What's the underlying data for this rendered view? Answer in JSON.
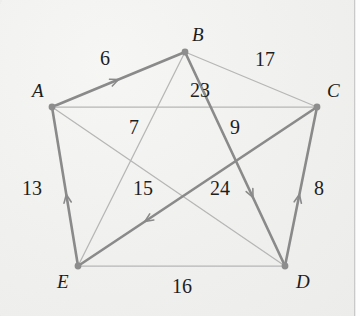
{
  "diagram": {
    "background_color": "#f1f1ef",
    "edge_color": "#8a8a8a",
    "thin_edge_color": "#b6b6b6",
    "node_color": "#8d8d8d",
    "label_color": "#1c1c1c"
  },
  "vertices": [
    {
      "id": "A",
      "label": "A",
      "x": 52,
      "y": 107,
      "label_x": 32,
      "label_y": 81
    },
    {
      "id": "B",
      "label": "B",
      "x": 185,
      "y": 52,
      "label_x": 192,
      "label_y": 25
    },
    {
      "id": "C",
      "label": "C",
      "x": 317,
      "y": 107,
      "label_x": 327,
      "label_y": 81
    },
    {
      "id": "D",
      "label": "D",
      "x": 285,
      "y": 266,
      "label_x": 296,
      "label_y": 272
    },
    {
      "id": "E",
      "label": "E",
      "x": 78,
      "y": 266,
      "label_x": 57,
      "label_y": 272
    }
  ],
  "edges": [
    {
      "id": "AB",
      "from": "A",
      "to": "B",
      "weight": "6",
      "directed": true,
      "style": "thick",
      "label_x": 100,
      "label_y": 48
    },
    {
      "id": "BC",
      "from": "B",
      "to": "C",
      "weight": "17",
      "directed": false,
      "style": "thin",
      "label_x": 255,
      "label_y": 49
    },
    {
      "id": "BE",
      "from": "B",
      "to": "E",
      "weight": "23",
      "directed": false,
      "style": "thin",
      "label_x": 190,
      "label_y": 80
    },
    {
      "id": "AC",
      "from": "A",
      "to": "C",
      "weight": "7",
      "directed": false,
      "style": "thin",
      "label_x": 129,
      "label_y": 117
    },
    {
      "id": "BD",
      "from": "B",
      "to": "D",
      "weight": "9",
      "directed": true,
      "style": "thick",
      "label_x": 230,
      "label_y": 117
    },
    {
      "id": "EA",
      "from": "E",
      "to": "A",
      "weight": "13",
      "directed": true,
      "style": "thick",
      "label_x": 22,
      "label_y": 178
    },
    {
      "id": "AD",
      "from": "A",
      "to": "D",
      "weight": "15",
      "directed": false,
      "style": "thin",
      "label_x": 133,
      "label_y": 178
    },
    {
      "id": "CE",
      "from": "C",
      "to": "E",
      "weight": "24",
      "directed": true,
      "style": "thick",
      "label_x": 210,
      "label_y": 178
    },
    {
      "id": "DC",
      "from": "D",
      "to": "C",
      "weight": "8",
      "directed": true,
      "style": "thick",
      "label_x": 314,
      "label_y": 178
    },
    {
      "id": "ED",
      "from": "E",
      "to": "D",
      "weight": "16",
      "directed": false,
      "style": "thin",
      "label_x": 172,
      "label_y": 276
    }
  ],
  "weights_list": [
    "6",
    "17",
    "23",
    "7",
    "9",
    "13",
    "15",
    "24",
    "8",
    "16"
  ]
}
